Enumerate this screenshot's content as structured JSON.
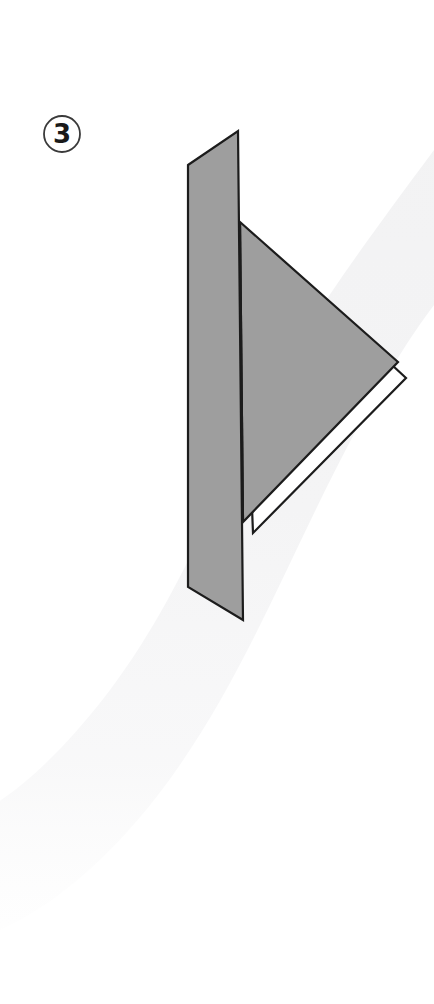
{
  "page": {
    "width": 434,
    "height": 1004,
    "background_color": "#ffffff",
    "kind": "origami-fold-instruction-diagram"
  },
  "step_badge": {
    "name": "step-number-badge",
    "number": "3",
    "circle": {
      "cx": 62,
      "cy": 134,
      "r": 18
    },
    "stroke_color": "#3a3a3a",
    "text_color": "#1a1a1a"
  },
  "background": {
    "swoosh": {
      "name": "background-swoosh",
      "color": "#f4f4f5",
      "description": "soft light-gray S-curve band sweeping from upper right to lower left"
    }
  },
  "figure": {
    "name": "folded-paper-figure",
    "fill_color": "#9e9e9e",
    "under_layer_color": "#ffffff",
    "outline_color": "#1c1c1c",
    "outline_width": 2.2,
    "parts": [
      {
        "name": "vertical-back-panel",
        "points": "188,165 238,131 243,620 188,587",
        "fill": "#9e9e9e"
      },
      {
        "name": "white-under-flap",
        "points": "241,225 406,378 253,533",
        "fill": "#ffffff"
      },
      {
        "name": "triangular-front-flap",
        "points": "240,222 398,362 243,522",
        "fill": "#9e9e9e"
      },
      {
        "name": "vertical-fold-crease",
        "from": "240,222",
        "to": "243,522"
      }
    ]
  }
}
